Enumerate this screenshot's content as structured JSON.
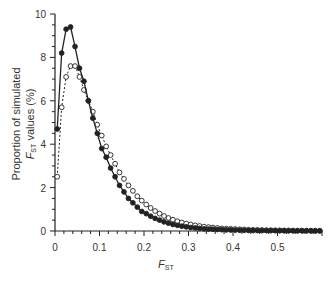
{
  "chart_data": {
    "type": "line",
    "title": "",
    "xlabel": "F_ST",
    "xlabel_main": "F",
    "xlabel_sub": "ST",
    "ylabel_line1": "Proportion of simulated",
    "ylabel_line2_main": "F",
    "ylabel_line2_sub": "ST",
    "ylabel_line2_rest": " values (%)",
    "ylabel": "Proportion of simulated F_ST values (%)",
    "xlim": [
      0,
      0.6
    ],
    "ylim": [
      0,
      10
    ],
    "x_ticks": [
      0,
      0.1,
      0.2,
      0.3,
      0.4,
      0.5
    ],
    "x_tick_labels": [
      "0",
      "0.1",
      "0.2",
      "0.3",
      "0.4",
      "0.5"
    ],
    "y_ticks": [
      0,
      2,
      4,
      6,
      8,
      10
    ],
    "y_tick_labels": [
      "0",
      "2",
      "4",
      "6",
      "8",
      "10"
    ],
    "grid": false,
    "legend": "none",
    "x": [
      0.005,
      0.015,
      0.025,
      0.035,
      0.045,
      0.055,
      0.065,
      0.075,
      0.085,
      0.095,
      0.105,
      0.115,
      0.125,
      0.135,
      0.145,
      0.155,
      0.165,
      0.175,
      0.185,
      0.195,
      0.205,
      0.215,
      0.225,
      0.235,
      0.245,
      0.255,
      0.265,
      0.275,
      0.285,
      0.295,
      0.305,
      0.315,
      0.325,
      0.335,
      0.345,
      0.355,
      0.365,
      0.375,
      0.385,
      0.395,
      0.405,
      0.415,
      0.425,
      0.435,
      0.445,
      0.455,
      0.465,
      0.475,
      0.485,
      0.495,
      0.505,
      0.515,
      0.525,
      0.535,
      0.545,
      0.555,
      0.565,
      0.575,
      0.585,
      0.595
    ],
    "series": [
      {
        "name": "filled circles (solid line)",
        "marker": "filled",
        "line": "solid",
        "values": [
          4.7,
          8.2,
          9.3,
          9.4,
          8.5,
          7.5,
          6.9,
          6.0,
          5.2,
          4.5,
          3.8,
          3.4,
          2.9,
          2.5,
          2.1,
          1.8,
          1.5,
          1.3,
          1.1,
          0.9,
          0.8,
          0.68,
          0.58,
          0.5,
          0.42,
          0.36,
          0.3,
          0.26,
          0.22,
          0.19,
          0.16,
          0.14,
          0.12,
          0.1,
          0.09,
          0.08,
          0.07,
          0.06,
          0.05,
          0.045,
          0.04,
          0.035,
          0.03,
          0.027,
          0.024,
          0.021,
          0.019,
          0.017,
          0.015,
          0.013,
          0.012,
          0.011,
          0.01,
          0.009,
          0.008,
          0.007,
          0.006,
          0.005,
          0.005,
          0.004
        ]
      },
      {
        "name": "open circles (dashed line)",
        "marker": "open",
        "line": "dashed",
        "values": [
          2.5,
          5.7,
          7.1,
          7.6,
          7.6,
          7.1,
          6.5,
          6.0,
          5.5,
          4.9,
          4.4,
          3.9,
          3.5,
          3.1,
          2.7,
          2.4,
          2.1,
          1.85,
          1.6,
          1.4,
          1.22,
          1.06,
          0.92,
          0.8,
          0.69,
          0.6,
          0.52,
          0.45,
          0.39,
          0.34,
          0.3,
          0.26,
          0.23,
          0.2,
          0.18,
          0.16,
          0.14,
          0.12,
          0.11,
          0.1,
          0.09,
          0.08,
          0.07,
          0.06,
          0.055,
          0.05,
          0.045,
          0.04,
          0.036,
          0.032,
          0.029,
          0.026,
          0.023,
          0.021,
          0.019,
          0.017,
          0.015,
          0.013,
          0.012,
          0.011
        ]
      }
    ]
  }
}
